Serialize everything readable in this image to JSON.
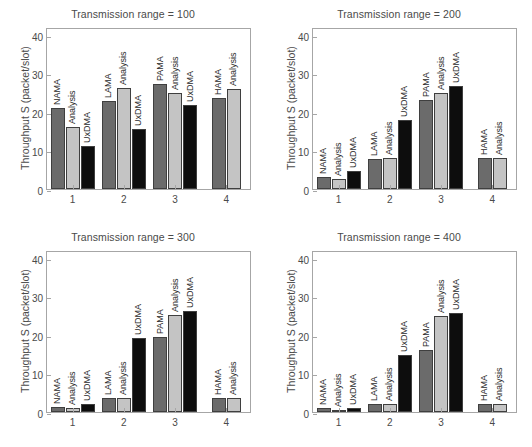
{
  "figure": {
    "width": 532,
    "height": 447,
    "background": "#ffffff",
    "ylabel": "Throughput S (packet/slot)",
    "yticks": [
      0,
      10,
      20,
      30,
      40
    ],
    "xticks": [
      "1",
      "2",
      "3",
      "4"
    ],
    "ylim": [
      0,
      42
    ],
    "series_colors": {
      "protocol": "#6b6b6b",
      "analysis": "#c4c4c4",
      "uxdma": "#0d0d0d"
    },
    "series_names": [
      "Protocol",
      "Analysis",
      "UxDMA"
    ]
  },
  "chart_data": [
    {
      "type": "bar",
      "title": "Transmission range = 100",
      "xlabel": "",
      "ylabel": "Throughput S (packet/slot)",
      "ylim": [
        0,
        42
      ],
      "yticks": [
        0,
        10,
        20,
        30,
        40
      ],
      "categories": [
        "1",
        "2",
        "3",
        "4"
      ],
      "group_names": [
        "NAMA",
        "LAMA",
        "PAMA",
        "HAMA"
      ],
      "grid": false,
      "legend": "none",
      "groups": [
        {
          "category": "1",
          "bars": [
            {
              "label": "NAMA",
              "value": 21.0,
              "color": "#6b6b6b"
            },
            {
              "label": "Analysis",
              "value": 16.2,
              "color": "#c4c4c4"
            },
            {
              "label": "UxDMA",
              "value": 11.1,
              "color": "#0d0d0d"
            }
          ]
        },
        {
          "category": "2",
          "bars": [
            {
              "label": "LAMA",
              "value": 22.8,
              "color": "#6b6b6b"
            },
            {
              "label": "Analysis",
              "value": 26.2,
              "color": "#c4c4c4"
            },
            {
              "label": "UxDMA",
              "value": 15.5,
              "color": "#0d0d0d"
            }
          ]
        },
        {
          "category": "3",
          "bars": [
            {
              "label": "PAMA",
              "value": 27.1,
              "color": "#6b6b6b"
            },
            {
              "label": "Analysis",
              "value": 25.0,
              "color": "#c4c4c4"
            },
            {
              "label": "UxDMA",
              "value": 21.9,
              "color": "#0d0d0d"
            }
          ]
        },
        {
          "category": "4",
          "bars": [
            {
              "label": "HAMA",
              "value": 23.6,
              "color": "#6b6b6b"
            },
            {
              "label": "Analysis",
              "value": 25.9,
              "color": "#c4c4c4"
            }
          ]
        }
      ]
    },
    {
      "type": "bar",
      "title": "Transmission range = 200",
      "xlabel": "",
      "ylabel": "Throughput S (packet/slot)",
      "ylim": [
        0,
        42
      ],
      "yticks": [
        0,
        10,
        20,
        30,
        40
      ],
      "categories": [
        "1",
        "2",
        "3",
        "4"
      ],
      "group_names": [
        "NAMA",
        "LAMA",
        "PAMA",
        "HAMA"
      ],
      "grid": false,
      "legend": "none",
      "groups": [
        {
          "category": "1",
          "bars": [
            {
              "label": "NAMA",
              "value": 3.0,
              "color": "#6b6b6b"
            },
            {
              "label": "Analysis",
              "value": 2.7,
              "color": "#c4c4c4"
            },
            {
              "label": "UxDMA",
              "value": 4.7,
              "color": "#0d0d0d"
            }
          ]
        },
        {
          "category": "2",
          "bars": [
            {
              "label": "LAMA",
              "value": 7.8,
              "color": "#6b6b6b"
            },
            {
              "label": "Analysis",
              "value": 8.1,
              "color": "#c4c4c4"
            },
            {
              "label": "UxDMA",
              "value": 18.0,
              "color": "#0d0d0d"
            }
          ]
        },
        {
          "category": "3",
          "bars": [
            {
              "label": "PAMA",
              "value": 23.0,
              "color": "#6b6b6b"
            },
            {
              "label": "Analysis",
              "value": 25.0,
              "color": "#c4c4c4"
            },
            {
              "label": "UxDMA",
              "value": 26.7,
              "color": "#0d0d0d"
            }
          ]
        },
        {
          "category": "4",
          "bars": [
            {
              "label": "HAMA",
              "value": 8.1,
              "color": "#6b6b6b"
            },
            {
              "label": "Analysis",
              "value": 8.0,
              "color": "#c4c4c4"
            }
          ]
        }
      ]
    },
    {
      "type": "bar",
      "title": "Transmission range = 300",
      "xlabel": "",
      "ylabel": "Throughput S (packet/slot)",
      "ylim": [
        0,
        42
      ],
      "yticks": [
        0,
        10,
        20,
        30,
        40
      ],
      "categories": [
        "1",
        "2",
        "3",
        "4"
      ],
      "group_names": [
        "NAMA",
        "LAMA",
        "PAMA",
        "HAMA"
      ],
      "grid": false,
      "legend": "none",
      "groups": [
        {
          "category": "1",
          "bars": [
            {
              "label": "NAMA",
              "value": 1.2,
              "color": "#6b6b6b"
            },
            {
              "label": "Analysis",
              "value": 1.0,
              "color": "#c4c4c4"
            },
            {
              "label": "UxDMA",
              "value": 2.0,
              "color": "#0d0d0d"
            }
          ]
        },
        {
          "category": "2",
          "bars": [
            {
              "label": "LAMA",
              "value": 3.6,
              "color": "#6b6b6b"
            },
            {
              "label": "Analysis",
              "value": 3.6,
              "color": "#c4c4c4"
            },
            {
              "label": "UxDMA",
              "value": 19.1,
              "color": "#0d0d0d"
            }
          ]
        },
        {
          "category": "3",
          "bars": [
            {
              "label": "PAMA",
              "value": 19.5,
              "color": "#6b6b6b"
            },
            {
              "label": "Analysis",
              "value": 25.2,
              "color": "#c4c4c4"
            },
            {
              "label": "UxDMA",
              "value": 26.1,
              "color": "#0d0d0d"
            }
          ]
        },
        {
          "category": "4",
          "bars": [
            {
              "label": "HAMA",
              "value": 3.6,
              "color": "#6b6b6b"
            },
            {
              "label": "Analysis",
              "value": 3.6,
              "color": "#c4c4c4"
            }
          ]
        }
      ]
    },
    {
      "type": "bar",
      "title": "Transmission range = 400",
      "xlabel": "",
      "ylabel": "Throughput S (packet/slot)",
      "ylim": [
        0,
        42
      ],
      "yticks": [
        0,
        10,
        20,
        30,
        40
      ],
      "categories": [
        "1",
        "2",
        "3",
        "4"
      ],
      "group_names": [
        "NAMA",
        "LAMA",
        "PAMA",
        "HAMA"
      ],
      "grid": false,
      "legend": "none",
      "groups": [
        {
          "category": "1",
          "bars": [
            {
              "label": "NAMA",
              "value": 1.0,
              "color": "#6b6b6b"
            },
            {
              "label": "Analysis",
              "value": 0.6,
              "color": "#c4c4c4"
            },
            {
              "label": "UxDMA",
              "value": 1.0,
              "color": "#0d0d0d"
            }
          ]
        },
        {
          "category": "2",
          "bars": [
            {
              "label": "LAMA",
              "value": 2.0,
              "color": "#6b6b6b"
            },
            {
              "label": "Analysis",
              "value": 2.0,
              "color": "#c4c4c4"
            },
            {
              "label": "UxDMA",
              "value": 14.7,
              "color": "#0d0d0d"
            }
          ]
        },
        {
          "category": "3",
          "bars": [
            {
              "label": "PAMA",
              "value": 16.1,
              "color": "#6b6b6b"
            },
            {
              "label": "Analysis",
              "value": 25.0,
              "color": "#c4c4c4"
            },
            {
              "label": "UxDMA",
              "value": 25.6,
              "color": "#0d0d0d"
            }
          ]
        },
        {
          "category": "4",
          "bars": [
            {
              "label": "HAMA",
              "value": 2.1,
              "color": "#6b6b6b"
            },
            {
              "label": "Analysis",
              "value": 2.1,
              "color": "#c4c4c4"
            }
          ]
        }
      ]
    }
  ]
}
